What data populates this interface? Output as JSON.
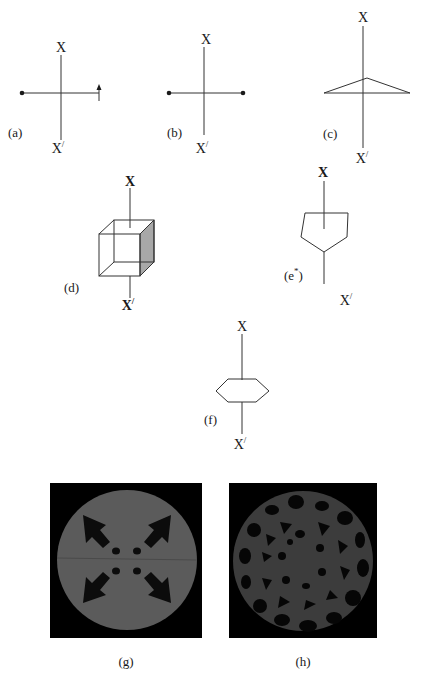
{
  "figure": {
    "panels": [
      {
        "id": "a",
        "label": "(a)",
        "top_axis": "X",
        "bottom_axis": "X/",
        "shape": "line-with-dot-and-arrow"
      },
      {
        "id": "b",
        "label": "(b)",
        "top_axis": "X",
        "bottom_axis": "X/",
        "shape": "line-with-two-dots"
      },
      {
        "id": "c",
        "label": "(c)",
        "top_axis": "X",
        "bottom_axis": "X/",
        "shape": "triangle"
      },
      {
        "id": "d",
        "label": "(d)",
        "top_axis": "X",
        "bottom_axis": "X/",
        "shape": "cube"
      },
      {
        "id": "e",
        "label": "(e*)",
        "label_main": "(e",
        "label_sup": "*",
        "label_close": ")",
        "top_axis": "X",
        "bottom_axis": "X/",
        "shape": "pentagon"
      },
      {
        "id": "f",
        "label": "(f)",
        "top_axis": "X",
        "bottom_axis": "X/",
        "shape": "hexagon"
      },
      {
        "id": "g",
        "label": "(g)",
        "shape": "reconstruction-image-four-arrows"
      },
      {
        "id": "h",
        "label": "(h)",
        "shape": "reconstruction-image-cellular"
      }
    ],
    "axis_top": "X",
    "axis_bottom_base": "X",
    "axis_bottom_prime": "/",
    "colors": {
      "line": "#333333",
      "image_bg": "#000000",
      "disk_gray_g": "#5b5b5b",
      "disk_gray_h": "#3c3c3c",
      "cube_shade": "#a8a8a8"
    }
  }
}
